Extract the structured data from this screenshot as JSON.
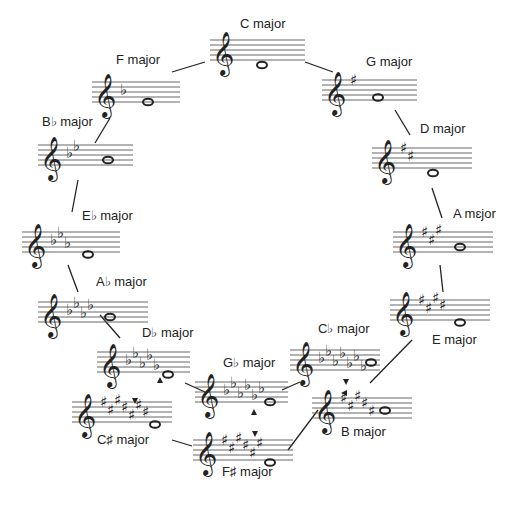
{
  "keys": [
    {
      "id": "c-major",
      "label": "C major",
      "accidental": "none",
      "count": 0,
      "staff": {
        "x": 210,
        "y": 40,
        "w": 95
      },
      "label_pos": {
        "x": 240,
        "y": 22
      },
      "note_x": 262,
      "note_step": -2
    },
    {
      "id": "g-major",
      "label": "G major",
      "accidental": "sharp",
      "count": 1,
      "staff": {
        "x": 322,
        "y": 80,
        "w": 95
      },
      "label_pos": {
        "x": 366,
        "y": 60
      },
      "note_x": 378,
      "note_step": 1
    },
    {
      "id": "d-major",
      "label": "D major",
      "accidental": "sharp",
      "count": 2,
      "staff": {
        "x": 372,
        "y": 148,
        "w": 100
      },
      "label_pos": {
        "x": 420,
        "y": 127
      },
      "note_x": 433,
      "note_step": -2
    },
    {
      "id": "a-major",
      "label": "A mɛjor",
      "accidental": "sharp",
      "count": 3,
      "staff": {
        "x": 393,
        "y": 232,
        "w": 100
      },
      "label_pos": {
        "x": 453,
        "y": 212
      },
      "note_x": 460,
      "note_step": 2
    },
    {
      "id": "e-major",
      "label": "E major",
      "accidental": "sharp",
      "count": 4,
      "staff": {
        "x": 390,
        "y": 300,
        "w": 100
      },
      "label_pos": {
        "x": 432,
        "y": 338
      },
      "note_x": 460,
      "note_step": -1
    },
    {
      "id": "b-major",
      "label": "B major",
      "accidental": "sharp",
      "count": 5,
      "staff": {
        "x": 312,
        "y": 398,
        "w": 100
      },
      "label_pos": {
        "x": 341,
        "y": 430
      },
      "note_x": 385,
      "note_step": 3
    },
    {
      "id": "f-sharp-major",
      "label": "F♯ major",
      "accidental": "sharp",
      "count": 6,
      "staff": {
        "x": 193,
        "y": 440,
        "w": 100
      },
      "label_pos": {
        "x": 222,
        "y": 470
      },
      "note_x": 270,
      "note_step": -1
    },
    {
      "id": "c-sharp-major",
      "label": "C♯ major",
      "accidental": "sharp",
      "count": 7,
      "staff": {
        "x": 72,
        "y": 402,
        "w": 100
      },
      "label_pos": {
        "x": 97,
        "y": 438
      },
      "note_x": 155,
      "note_step": -1
    },
    {
      "id": "c-flat-major",
      "label": "C♭ major",
      "accidental": "flat",
      "count": 7,
      "staff": {
        "x": 290,
        "y": 350,
        "w": 90
      },
      "label_pos": {
        "x": 318,
        "y": 327
      },
      "note_x": 371,
      "note_step": 3
    },
    {
      "id": "g-flat-major",
      "label": "G♭ major",
      "accidental": "flat",
      "count": 6,
      "staff": {
        "x": 195,
        "y": 382,
        "w": 93
      },
      "label_pos": {
        "x": 223,
        "y": 361
      },
      "note_x": 270,
      "note_step": 0
    },
    {
      "id": "d-flat-major",
      "label": "D♭ major",
      "accidental": "flat",
      "count": 5,
      "staff": {
        "x": 97,
        "y": 352,
        "w": 93
      },
      "label_pos": {
        "x": 142,
        "y": 331
      },
      "note_x": 168,
      "note_step": -1
    },
    {
      "id": "a-flat-major",
      "label": "A♭ major",
      "accidental": "flat",
      "count": 4,
      "staff": {
        "x": 38,
        "y": 302,
        "w": 110
      },
      "label_pos": {
        "x": 96,
        "y": 280
      },
      "note_x": 110,
      "note_step": 2
    },
    {
      "id": "e-flat-major",
      "label": "E♭ major",
      "accidental": "flat",
      "count": 3,
      "staff": {
        "x": 22,
        "y": 232,
        "w": 98
      },
      "label_pos": {
        "x": 82,
        "y": 214
      },
      "note_x": 88,
      "note_step": -1
    },
    {
      "id": "b-flat-major",
      "label": "B♭ major",
      "accidental": "flat",
      "count": 2,
      "staff": {
        "x": 38,
        "y": 145,
        "w": 95
      },
      "label_pos": {
        "x": 42,
        "y": 120
      },
      "note_x": 108,
      "note_step": 2
    },
    {
      "id": "f-major",
      "label": "F major",
      "accidental": "flat",
      "count": 1,
      "staff": {
        "x": 92,
        "y": 82,
        "w": 88
      },
      "label_pos": {
        "x": 116,
        "y": 58
      },
      "note_x": 148,
      "note_step": 0
    }
  ],
  "connectors": [
    [
      172,
      72,
      205,
      62
    ],
    [
      305,
      62,
      333,
      72
    ],
    [
      395,
      110,
      410,
      135
    ],
    [
      432,
      188,
      442,
      218
    ],
    [
      440,
      265,
      443,
      292
    ],
    [
      412,
      340,
      370,
      383
    ],
    [
      318,
      410,
      288,
      450
    ],
    [
      172,
      440,
      192,
      446
    ],
    [
      110,
      118,
      95,
      143
    ],
    [
      78,
      180,
      72,
      212
    ],
    [
      68,
      265,
      78,
      292
    ],
    [
      100,
      315,
      120,
      338
    ],
    [
      185,
      383,
      205,
      392
    ],
    [
      282,
      390,
      300,
      382
    ]
  ],
  "markers": [
    {
      "x": 160,
      "y": 381,
      "dir": "up"
    },
    {
      "x": 254,
      "y": 413,
      "dir": "up"
    },
    {
      "x": 346,
      "y": 381,
      "dir": "down"
    },
    {
      "x": 135,
      "y": 400,
      "dir": "down"
    },
    {
      "x": 255,
      "y": 433,
      "dir": "down"
    },
    {
      "x": 345,
      "y": 393,
      "dir": "left"
    }
  ],
  "colors": {
    "ink": "#222222",
    "staff_line": "#555555",
    "background": "#ffffff"
  }
}
